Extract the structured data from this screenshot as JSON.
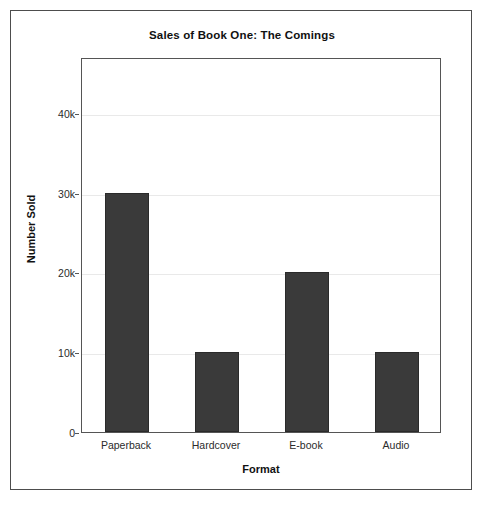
{
  "figure": {
    "background_color": "#ffffff",
    "frame_color": "#4d4d4d",
    "bar_color": "#3a3a3a",
    "gridline_color": "#e9e9e9"
  },
  "chart_data": {
    "type": "bar",
    "title": "Sales of Book One: The Comings",
    "xlabel": "Format",
    "ylabel": "Number Sold",
    "categories": [
      "Paperback",
      "Hardcover",
      "E-book",
      "Audio"
    ],
    "values": [
      30000,
      10000,
      20000,
      10000
    ],
    "ylim": [
      0,
      47000
    ],
    "yticks": [
      0,
      10000,
      20000,
      30000,
      40000
    ],
    "ytick_labels": [
      "0",
      "10k",
      "20k",
      "30k",
      "40k"
    ],
    "grid": true,
    "legend": null,
    "series": [
      {
        "name": "Number Sold",
        "color": "#3a3a3a",
        "values": [
          30000,
          10000,
          20000,
          10000
        ]
      }
    ]
  }
}
